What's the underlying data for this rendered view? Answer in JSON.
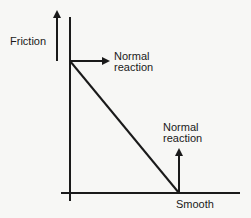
{
  "diagram": {
    "labels": {
      "friction": "Friction",
      "normal_top_line1": "Normal",
      "normal_top_line2": "reaction",
      "normal_bottom_line1": "Normal",
      "normal_bottom_line2": "reaction",
      "smooth": "Smooth"
    },
    "colors": {
      "ink": "#1a1a1a",
      "background": "#f7f7f5"
    }
  }
}
